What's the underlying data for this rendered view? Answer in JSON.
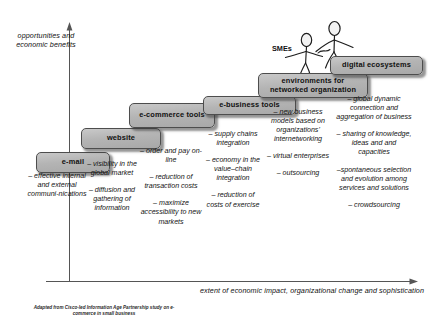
{
  "axes": {
    "y_label": "opportunities and economic benefits",
    "x_label": "extent of economic impact, organizational change and sophistication"
  },
  "actors": {
    "smes_label": "SMEs"
  },
  "source_note": "Adapted from Cisco-led Information Age Partnership study on e-commerce in small business",
  "stages": [
    {
      "id": "email",
      "title": "e-mail",
      "benefits": [
        "– effective internal and external communi-nications"
      ]
    },
    {
      "id": "website",
      "title": "website",
      "benefits": [
        "– visibility in the global market",
        "– diffusion and gathering of information"
      ]
    },
    {
      "id": "ecommerce-tools",
      "title": "e-commerce tools",
      "benefits": [
        "– order and pay on-line",
        "– reduction of transaction costs",
        "– maximize accessibility to new markets"
      ]
    },
    {
      "id": "e-business-tools",
      "title": "e-business tools",
      "benefits": [
        "– supply chains integration",
        "– economy in the value–chain integration",
        "– reduction of costs of exercise"
      ]
    },
    {
      "id": "networked-organization",
      "title": "environments for networked organization",
      "benefits": [
        "– new business models based on organizations' internetworking",
        "– virtual enterprises",
        "– outsourcing"
      ]
    },
    {
      "id": "digital-ecosystems",
      "title": "digital ecosystems",
      "benefits": [
        "– global dynamic connection and aggregation of business",
        "– sharing of knowledge, ideas and and capacities",
        "–spontaneous selection and evolution among services and solutions",
        "– crowdsourcing"
      ]
    }
  ]
}
